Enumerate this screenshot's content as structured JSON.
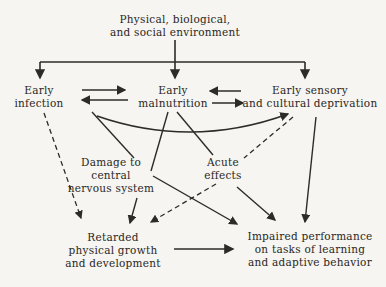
{
  "diagram": {
    "colors": {
      "ink": "#2e2b27",
      "paper": "#f6f5f1"
    },
    "nodes": {
      "environment": {
        "lines": [
          "Physical, biological,",
          "and social environment"
        ]
      },
      "infection": {
        "lines": [
          "Early",
          "infection"
        ]
      },
      "malnutrition": {
        "lines": [
          "Early",
          "malnutrition"
        ]
      },
      "deprivation": {
        "lines": [
          "Early sensory",
          "and cultural deprivation"
        ]
      },
      "cns": {
        "lines": [
          "Damage to",
          "central",
          "nervous system"
        ]
      },
      "acute": {
        "lines": [
          "Acute",
          "effects"
        ]
      },
      "retarded": {
        "lines": [
          "Retarded",
          "physical growth",
          "and development"
        ]
      },
      "impaired": {
        "lines": [
          "Impaired performance",
          "on tasks of learning",
          "and adaptive behavior"
        ]
      }
    },
    "edges": [
      {
        "id": "env-stem",
        "from": "environment",
        "to": "malnutrition",
        "style": "solid",
        "arrow": true,
        "w": 1.6,
        "d": "M175,40 L175,78"
      },
      {
        "id": "env-bar",
        "from": "environment",
        "to": "branch",
        "style": "solid",
        "arrow": false,
        "w": 1.6,
        "d": "M40,62 L305,62"
      },
      {
        "id": "env-drop-left",
        "from": "environment",
        "to": "infection",
        "style": "solid",
        "arrow": true,
        "w": 1.6,
        "d": "M40,62 L40,78"
      },
      {
        "id": "env-drop-right",
        "from": "environment",
        "to": "deprivation",
        "style": "solid",
        "arrow": true,
        "w": 1.6,
        "d": "M305,62 L305,78"
      },
      {
        "id": "infection-malnutrition",
        "from": "infection",
        "to": "malnutrition",
        "style": "solid",
        "arrow": true,
        "w": 1.5,
        "d": "M82,90 L125,90"
      },
      {
        "id": "malnutrition-infection",
        "from": "malnutrition",
        "to": "infection",
        "style": "solid",
        "arrow": true,
        "w": 1.5,
        "d": "M128,100 L82,100"
      },
      {
        "id": "deprivation-malnutrition",
        "from": "deprivation",
        "to": "malnutrition",
        "style": "solid",
        "arrow": true,
        "w": 1.5,
        "d": "M241,91 L210,91"
      },
      {
        "id": "malnutrition-deprivation",
        "from": "malnutrition",
        "to": "deprivation",
        "style": "solid",
        "arrow": true,
        "w": 1.5,
        "d": "M212,103 L243,103"
      },
      {
        "id": "infection-cns",
        "from": "infection",
        "to": "cns",
        "style": "solid",
        "arrow": false,
        "w": 1.4,
        "d": "M92,112 L134,158"
      },
      {
        "id": "infection-deprivation",
        "from": "infection",
        "to": "deprivation",
        "style": "solid",
        "arrow": true,
        "w": 1.4,
        "d": "M97,116 Q192,149 288,114"
      },
      {
        "id": "malnutrition-cns",
        "from": "malnutrition",
        "to": "cns",
        "style": "solid",
        "arrow": false,
        "w": 1.4,
        "d": "M168,112 L151,171"
      },
      {
        "id": "malnutrition-acute",
        "from": "malnutrition",
        "to": "acute",
        "style": "solid",
        "arrow": false,
        "w": 1.4,
        "d": "M177,112 L213,155"
      },
      {
        "id": "cns-retarded",
        "from": "cns",
        "to": "retarded",
        "style": "solid",
        "arrow": true,
        "w": 1.4,
        "d": "M137,198 L130,223"
      },
      {
        "id": "cns-impaired",
        "from": "cns",
        "to": "impaired",
        "style": "solid",
        "arrow": true,
        "w": 1.4,
        "d": "M153,176 L237,224"
      },
      {
        "id": "acute-impaired",
        "from": "acute",
        "to": "impaired",
        "style": "solid",
        "arrow": true,
        "w": 1.4,
        "d": "M237,187 L275,220"
      },
      {
        "id": "deprivation-impaired",
        "from": "deprivation",
        "to": "impaired",
        "style": "solid",
        "arrow": true,
        "w": 1.4,
        "d": "M316,117 L305,222"
      },
      {
        "id": "retarded-impaired",
        "from": "retarded",
        "to": "impaired",
        "style": "solid",
        "arrow": true,
        "w": 1.6,
        "d": "M174,249 L233,249"
      },
      {
        "id": "infection-retarded",
        "from": "infection",
        "to": "retarded",
        "style": "dashed",
        "arrow": true,
        "w": 1.3,
        "d": "M44,113 L81,218"
      },
      {
        "id": "deprivation-retarded-a",
        "from": "deprivation",
        "to": "retarded",
        "style": "dashed",
        "arrow": false,
        "w": 1.3,
        "d": "M293,117 L244,158"
      },
      {
        "id": "deprivation-retarded-b",
        "from": "deprivation",
        "to": "retarded",
        "style": "dashed",
        "arrow": true,
        "w": 1.3,
        "d": "M216,184 L151,222"
      }
    ]
  }
}
